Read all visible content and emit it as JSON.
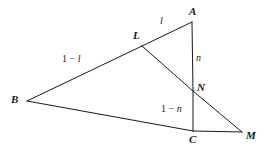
{
  "figure": {
    "kind": "geometry-diagram",
    "background_color": "#ffffff",
    "stroke_color": "#1a1a1a",
    "label_color": "#1a1a1a",
    "width": 265,
    "height": 152,
    "points": {
      "A": {
        "label": "A",
        "x": 192,
        "y": 22,
        "label_x": 189,
        "label_y": 6
      },
      "B": {
        "label": "B",
        "x": 27,
        "y": 101,
        "label_x": 11,
        "label_y": 94
      },
      "C": {
        "label": "C",
        "x": 193,
        "y": 131,
        "label_x": 189,
        "label_y": 134
      },
      "L": {
        "label": "L",
        "x": 142,
        "y": 46,
        "label_x": 133,
        "label_y": 30
      },
      "N": {
        "label": "N",
        "x": 193,
        "y": 91,
        "label_x": 197,
        "label_y": 82
      },
      "M": {
        "label": "M",
        "x": 242,
        "y": 132,
        "label_x": 246,
        "label_y": 130
      }
    },
    "segments": [
      {
        "name": "segment-A-L",
        "from": "A",
        "to": "L"
      },
      {
        "name": "segment-L-B",
        "from": "L",
        "to": "B"
      },
      {
        "name": "segment-A-N",
        "from": "A",
        "to": "N"
      },
      {
        "name": "segment-N-C",
        "from": "N",
        "to": "C"
      },
      {
        "name": "segment-B-C",
        "from": "B",
        "to": "C"
      },
      {
        "name": "segment-C-M",
        "from": "C",
        "to": "M"
      },
      {
        "name": "segment-L-N",
        "from": "L",
        "to": "N"
      },
      {
        "name": "segment-N-M",
        "from": "N",
        "to": "M"
      }
    ],
    "edge_labels": {
      "AL": {
        "text": "l",
        "x": 160,
        "y": 16,
        "for": "segment-A-L"
      },
      "LB": {
        "text": "1 − l",
        "prefix": "1 − ",
        "symbol": "l",
        "x": 62,
        "y": 54,
        "for": "segment-L-B"
      },
      "AN": {
        "text": "n",
        "x": 196,
        "y": 53,
        "for": "segment-A-N"
      },
      "NC": {
        "text": "1 − n",
        "prefix": "1 − ",
        "symbol": "n",
        "x": 161,
        "y": 104,
        "for": "segment-N-C"
      }
    }
  }
}
